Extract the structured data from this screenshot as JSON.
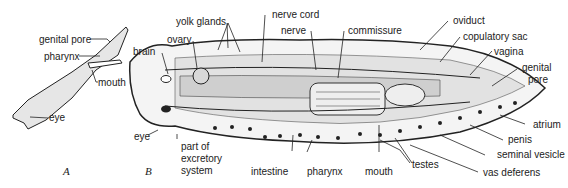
{
  "figure": {
    "panel_a": {
      "caption": "A",
      "labels": {
        "genital_pore": "genital pore",
        "pharynx": "pharynx",
        "mouth": "mouth",
        "eye": "eye"
      }
    },
    "panel_b": {
      "caption": "B",
      "labels": {
        "yolk_glands": "yolk glands",
        "nerve_cord": "nerve cord",
        "nerve": "nerve",
        "commissure": "commissure",
        "oviduct": "oviduct",
        "copulatory_sac": "copulatory sac",
        "vagina": "vagina",
        "genital_pore_1": "genital",
        "genital_pore_2": "pore",
        "ovary": "ovary",
        "brain": "brain",
        "eye": "eye",
        "excretory_1": "part of",
        "excretory_2": "excretory",
        "excretory_3": "system",
        "intestine": "intestine",
        "pharynx": "pharynx",
        "mouth": "mouth",
        "testes": "testes",
        "atrium": "atrium",
        "penis": "penis",
        "seminal_vesicle": "seminal vesicle",
        "vas_deferens": "vas deferens"
      }
    }
  },
  "colors": {
    "ink": "#222222",
    "stipple": "#b8b8b8",
    "background": "#ffffff"
  }
}
